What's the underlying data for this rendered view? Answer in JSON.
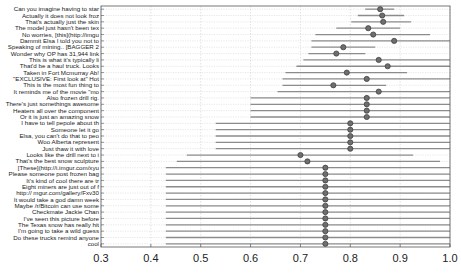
{
  "chart_data": {
    "type": "scatter",
    "subtype": "dot-with-interval (horizontal error bars)",
    "title": "",
    "xlabel": "",
    "ylabel": "",
    "xlim": [
      0.3,
      1.0
    ],
    "xticks": [
      "0.3",
      "0.4",
      "0.5",
      "0.6",
      "0.7",
      "0.8",
      "0.9",
      "1.0"
    ],
    "grid": true,
    "legend": null,
    "rows": [
      {
        "label": "Can you imagine having to star",
        "value": 0.86,
        "low": 0.83,
        "high": 0.888
      },
      {
        "label": "Actually it does not look froz",
        "value": 0.864,
        "low": 0.815,
        "high": 0.908
      },
      {
        "label": "That's actually just the skin",
        "value": 0.866,
        "low": 0.802,
        "high": 0.922
      },
      {
        "label": "The model just hasn't been tex",
        "value": 0.836,
        "low": 0.772,
        "high": 0.9
      },
      {
        "label": "No worries, [this](http://imgu",
        "value": 0.846,
        "low": 0.73,
        "high": 0.96
      },
      {
        "label": "Dammit Elsa I told you not to",
        "value": 0.888,
        "low": 0.722,
        "high": 1.0
      },
      {
        "label": "Speaking of mining.. [BAGGER 2",
        "value": 0.786,
        "low": 0.722,
        "high": 0.85
      },
      {
        "label": "Wonder why OP has 31,944 link",
        "value": 0.772,
        "low": 0.716,
        "high": 0.83
      },
      {
        "label": "This is what it's typically li",
        "value": 0.857,
        "low": 0.706,
        "high": 1.0
      },
      {
        "label": "That'd be a haul truck. Looks",
        "value": 0.875,
        "low": 0.692,
        "high": 1.0
      },
      {
        "label": "Taken in Fort Mcmurray Ab!",
        "value": 0.793,
        "low": 0.67,
        "high": 0.914
      },
      {
        "label": "\"EXCLUSIVE: First look at\" Hot",
        "value": 0.833,
        "low": 0.664,
        "high": 1.0
      },
      {
        "label": "This is the most fun thing to",
        "value": 0.766,
        "low": 0.664,
        "high": 0.872
      },
      {
        "label": "It reminds me of the movie \"mo",
        "value": 0.857,
        "low": 0.654,
        "high": 1.0
      },
      {
        "label": "Also frozen drill rig.",
        "value": 0.833,
        "low": 0.6,
        "high": 1.0
      },
      {
        "label": "There's just somethings awesome",
        "value": 0.833,
        "low": 0.6,
        "high": 1.0
      },
      {
        "label": "Heaters all over the component",
        "value": 0.833,
        "low": 0.6,
        "high": 1.0
      },
      {
        "label": "Or it is just an amazing snow",
        "value": 0.833,
        "low": 0.6,
        "high": 1.0
      },
      {
        "label": "I have to tell pepole about th",
        "value": 0.8,
        "low": 0.53,
        "high": 1.0
      },
      {
        "label": "Someone let it go",
        "value": 0.8,
        "low": 0.53,
        "high": 1.0
      },
      {
        "label": "Elsa, you can't do that to peo",
        "value": 0.8,
        "low": 0.53,
        "high": 1.0
      },
      {
        "label": "Woo Alberta represent",
        "value": 0.8,
        "low": 0.53,
        "high": 1.0
      },
      {
        "label": "Just thaw it with love",
        "value": 0.8,
        "low": 0.53,
        "high": 1.0
      },
      {
        "label": "Looks like the drill next to i",
        "value": 0.7,
        "low": 0.472,
        "high": 0.926
      },
      {
        "label": "That's the best snow sculpture",
        "value": 0.714,
        "low": 0.452,
        "high": 0.98
      },
      {
        "label": "[These](http://i.imgur.com/xyu",
        "value": 0.75,
        "low": 0.43,
        "high": 1.0
      },
      {
        "label": "Please someone post frozen bag",
        "value": 0.75,
        "low": 0.43,
        "high": 1.0
      },
      {
        "label": "It's kind of cool there are tr",
        "value": 0.75,
        "low": 0.43,
        "high": 1.0
      },
      {
        "label": "Eight miners are just out of f",
        "value": 0.75,
        "low": 0.43,
        "high": 1.0
      },
      {
        "label": "http:// mgur.com/gallery/Fxv30",
        "value": 0.75,
        "low": 0.43,
        "high": 1.0
      },
      {
        "label": "It would take a god damn week",
        "value": 0.75,
        "low": 0.43,
        "high": 1.0
      },
      {
        "label": "Maybe /r/Bitcoin can use some",
        "value": 0.75,
        "low": 0.43,
        "high": 1.0
      },
      {
        "label": "Checkmate Jackie Chan",
        "value": 0.75,
        "low": 0.43,
        "high": 1.0
      },
      {
        "label": "I've seen this picture before",
        "value": 0.75,
        "low": 0.43,
        "high": 1.0
      },
      {
        "label": "The Texas snow has really hit",
        "value": 0.75,
        "low": 0.43,
        "high": 1.0
      },
      {
        "label": "I'm going to take a wild guess",
        "value": 0.75,
        "low": 0.43,
        "high": 1.0
      },
      {
        "label": "Do these trucks remind anyone",
        "value": 0.75,
        "low": 0.43,
        "high": 1.0
      },
      {
        "label": "cool",
        "value": 0.75,
        "low": 0.43,
        "high": 1.0
      }
    ]
  },
  "style": {
    "dot_fill": "#6e6e6e",
    "dot_stroke": "#3a3a3a",
    "bar_color": "#8c8c8c",
    "grid_color": "#cfcfcf",
    "axis_color": "#555555"
  }
}
